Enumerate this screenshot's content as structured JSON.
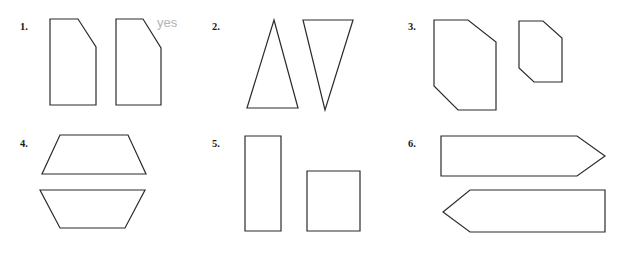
{
  "page": {
    "width": 635,
    "height": 257,
    "background": "#ffffff",
    "stroke_color": "#2b2b2b",
    "fill_color": "#ffffff",
    "number_color": "#1a1a1a",
    "annotation_color": "#b3b3b3"
  },
  "annotations": [
    {
      "text": "yes",
      "x": 157,
      "y": 16
    }
  ],
  "problems": [
    {
      "number": "1.",
      "number_x": 20,
      "number_y": 22,
      "shapes": [
        {
          "name": "pentagon-clipped-rectangle-left",
          "type": "polygon",
          "points": "50,19 78,19 96,47 96,105 50,105"
        },
        {
          "name": "pentagon-clipped-rectangle-right",
          "type": "polygon",
          "points": "116,19 143,19 161,48 161,105 116,105"
        }
      ]
    },
    {
      "number": "2.",
      "number_x": 212,
      "number_y": 22,
      "shapes": [
        {
          "name": "triangle-up",
          "type": "polygon",
          "points": "274,20 298,108 247,108"
        },
        {
          "name": "triangle-down",
          "type": "polygon",
          "points": "303,20 353,20 325,110"
        }
      ]
    },
    {
      "number": "3.",
      "number_x": 408,
      "number_y": 22,
      "shapes": [
        {
          "name": "hexagon-large",
          "type": "polygon",
          "points": "434,20 468,20 496,42 496,110 458,110 434,86"
        },
        {
          "name": "hexagon-small",
          "type": "polygon",
          "points": "519,21 543,21 562,38 562,82 534,82 519,68"
        }
      ]
    },
    {
      "number": "4.",
      "number_x": 20,
      "number_y": 139,
      "shapes": [
        {
          "name": "trapezoid-upright",
          "type": "polygon",
          "points": "60,135 128,135 146,174 42,174"
        },
        {
          "name": "trapezoid-inverted",
          "type": "polygon",
          "points": "40,190 145,190 125,228 60,228"
        }
      ]
    },
    {
      "number": "5.",
      "number_x": 212,
      "number_y": 139,
      "shapes": [
        {
          "name": "rectangle-tall",
          "type": "polygon",
          "points": "245,136 281,136 281,231 245,231"
        },
        {
          "name": "square",
          "type": "polygon",
          "points": "307,171 360,171 360,231 307,231"
        }
      ]
    },
    {
      "number": "6.",
      "number_x": 408,
      "number_y": 139,
      "shapes": [
        {
          "name": "arrow-pentagon-right",
          "type": "polygon",
          "points": "441,136 577,136 605,156 577,176 441,176"
        },
        {
          "name": "arrow-pentagon-left",
          "type": "polygon",
          "points": "470,190 605,190 605,232 470,232 443,212"
        }
      ]
    }
  ]
}
